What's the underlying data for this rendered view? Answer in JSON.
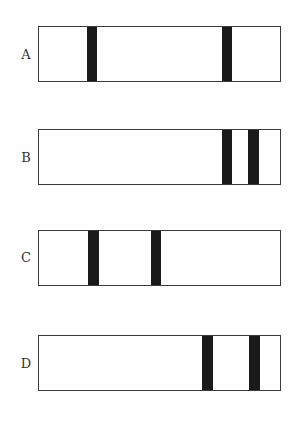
{
  "figure": {
    "rows": [
      {
        "label": "A",
        "top": 26,
        "bands": [
          {
            "x": 49,
            "w": 10
          },
          {
            "x": 184,
            "w": 10
          }
        ]
      },
      {
        "label": "B",
        "top": 129,
        "bands": [
          {
            "x": 184,
            "w": 10
          },
          {
            "x": 210,
            "w": 11
          }
        ]
      },
      {
        "label": "C",
        "top": 230,
        "bands": [
          {
            "x": 50,
            "w": 11
          },
          {
            "x": 113,
            "w": 10
          }
        ]
      },
      {
        "label": "D",
        "top": 335,
        "bands": [
          {
            "x": 164,
            "w": 11
          },
          {
            "x": 211,
            "w": 11
          }
        ]
      }
    ],
    "colors": {
      "band": "#1a1a1a",
      "border": "#3a3a3a",
      "background": "#ffffff"
    }
  }
}
